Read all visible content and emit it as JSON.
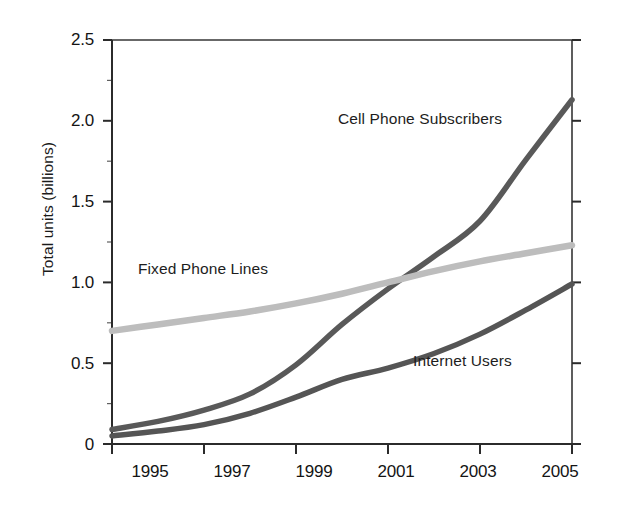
{
  "chart_data": {
    "type": "line",
    "title": "",
    "subtitle": "",
    "xlabel": "",
    "ylabel": "Total units (billions)",
    "xlim": [
      1995,
      2005
    ],
    "ylim": [
      0,
      2.5
    ],
    "grid": false,
    "legend_position": "inline-annotations",
    "x_ticks": [
      "1995",
      "1997",
      "1999",
      "2001",
      "2003",
      "2005"
    ],
    "x_tick_values": [
      1995,
      1997,
      1999,
      2001,
      2003,
      2005
    ],
    "y_ticks": [
      "0",
      "0.5",
      "1.0",
      "1.5",
      "2.0",
      "2.5"
    ],
    "y_tick_values": [
      0,
      0.5,
      1.0,
      1.5,
      2.0,
      2.5
    ],
    "x": [
      1995,
      1996,
      1997,
      1998,
      1999,
      2000,
      2001,
      2002,
      2003,
      2004,
      2005
    ],
    "series": [
      {
        "name": "Cell Phone Subscribers",
        "color": "#595959",
        "width": 5.5,
        "values": [
          0.09,
          0.14,
          0.21,
          0.31,
          0.49,
          0.74,
          0.96,
          1.16,
          1.38,
          1.76,
          2.13
        ],
        "label_x": 2000.2,
        "label_y": 2.06
      },
      {
        "name": "Fixed Phone Lines",
        "color": "#bdbdbd",
        "width": 6.5,
        "values": [
          0.7,
          0.74,
          0.78,
          0.82,
          0.87,
          0.93,
          1.0,
          1.07,
          1.13,
          1.18,
          1.23
        ],
        "label_x": 1995.5,
        "label_y": 1.22
      },
      {
        "name": "Internet Users",
        "color": "#555555",
        "width": 5.5,
        "values": [
          0.05,
          0.08,
          0.12,
          0.19,
          0.29,
          0.4,
          0.47,
          0.56,
          0.68,
          0.83,
          0.99
        ],
        "label_x": 2001.6,
        "label_y": 0.61
      }
    ]
  },
  "axes": {
    "y_axis_title": "Total units (billions)",
    "y_tick_labels": [
      "2.5",
      "2.0",
      "1.5",
      "1.0",
      "0.5",
      "0"
    ],
    "x_tick_labels": [
      "1995",
      "1997",
      "1999",
      "2001",
      "2003",
      "2005"
    ]
  },
  "annotations": {
    "cell_phone": "Cell Phone Subscribers",
    "fixed_phone": "Fixed Phone Lines",
    "internet": "Internet Users"
  },
  "colors": {
    "axis": "#2b2b2b",
    "cell_phone": "#595959",
    "fixed_phone": "#bdbdbd",
    "internet": "#555555",
    "text": "#141414",
    "background": "#ffffff"
  }
}
